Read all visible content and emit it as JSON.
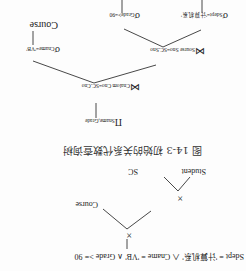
{
  "caption": "图 14-3   初始的关系代数查询树",
  "tree_top": {
    "selection_line": {
      "sigma": "σ",
      "prefix": "Sdept",
      "eq1": " = ",
      "val1": "'计算机系'",
      "and1": " ∧ Cname = ",
      "val2": "'VB'",
      "and2": " ∧ Grade >= 90"
    },
    "cross_1": "×",
    "cross_2": "×",
    "course": "Course",
    "student": "Student",
    "sc": "SC"
  },
  "tree_bottom": {
    "projection": {
      "symbol": "Π",
      "attrs": "Sname,Grade"
    },
    "join_1": {
      "symbol": "⋈",
      "cond": "Cnalom Cno=SC.Cno"
    },
    "join_2": {
      "symbol": "⋈",
      "cond": "Sourse Sno=SC.Sno"
    },
    "sel_cname": {
      "symbol": "σ",
      "cond": "Cname='VB'"
    },
    "sel_grade": {
      "symbol": "σ",
      "cond": "Grade>=90"
    },
    "sel_sdept": {
      "symbol": "σ",
      "cond": "Sdept='计算机系'"
    },
    "course": "Course"
  }
}
